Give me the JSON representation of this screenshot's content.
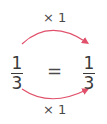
{
  "top_operation": "× 1",
  "bottom_operation": "× 1",
  "left_fraction": {
    "numerator": "1",
    "denominator": "3"
  },
  "right_fraction": {
    "numerator": "1",
    "denominator": "3"
  },
  "equals": "=",
  "colors": {
    "arrow": "#e0506a",
    "text": "#3a3a3a"
  }
}
